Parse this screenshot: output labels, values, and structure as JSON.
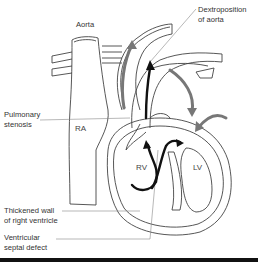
{
  "diagram": {
    "labels": {
      "aorta": "Aorta",
      "dextroposition_line1": "Dextroposition",
      "dextroposition_line2": "of aorta",
      "pulmonary_line1": "Pulmonary",
      "pulmonary_line2": "stenosis",
      "thickened_line1": "Thickened wall",
      "thickened_line2": "of right ventricle",
      "vsd_line1": "Ventricular",
      "vsd_line2": "septal defect"
    },
    "chambers": {
      "ra": "RA",
      "rv": "RV",
      "lv": "LV"
    },
    "colors": {
      "outline": "#444444",
      "arrow_dark": "#111111",
      "arrow_gray": "#777777",
      "leader_line": "#888888",
      "bottom_bar": "#111111"
    }
  }
}
